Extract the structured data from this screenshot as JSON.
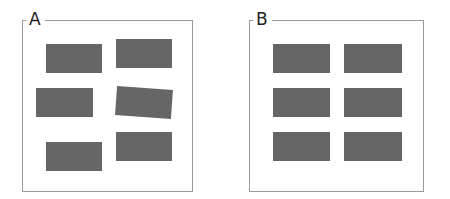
{
  "panels": [
    {
      "label": "A",
      "description": "irregularly arranged rectangles",
      "rect_color": "#666666",
      "rects": [
        {
          "x": 46,
          "y": 44,
          "w": 56,
          "h": 29,
          "rotate": 0
        },
        {
          "x": 116,
          "y": 39,
          "w": 56,
          "h": 29,
          "rotate": 0
        },
        {
          "x": 36,
          "y": 88,
          "w": 57,
          "h": 29,
          "rotate": 0
        },
        {
          "x": 116,
          "y": 88,
          "w": 56,
          "h": 29,
          "rotate": 4
        },
        {
          "x": 46,
          "y": 142,
          "w": 56,
          "h": 29,
          "rotate": 0
        },
        {
          "x": 116,
          "y": 132,
          "w": 56,
          "h": 29,
          "rotate": 0
        }
      ]
    },
    {
      "label": "B",
      "description": "rectangles aligned in a 3x2 grid",
      "rect_color": "#666666",
      "rects": [
        {
          "x": 273,
          "y": 44,
          "w": 57,
          "h": 29,
          "rotate": 0
        },
        {
          "x": 344,
          "y": 44,
          "w": 58,
          "h": 29,
          "rotate": 0
        },
        {
          "x": 273,
          "y": 88,
          "w": 57,
          "h": 29,
          "rotate": 0
        },
        {
          "x": 344,
          "y": 88,
          "w": 58,
          "h": 29,
          "rotate": 0
        },
        {
          "x": 273,
          "y": 132,
          "w": 57,
          "h": 29,
          "rotate": 0
        },
        {
          "x": 344,
          "y": 132,
          "w": 58,
          "h": 29,
          "rotate": 0
        }
      ]
    }
  ]
}
